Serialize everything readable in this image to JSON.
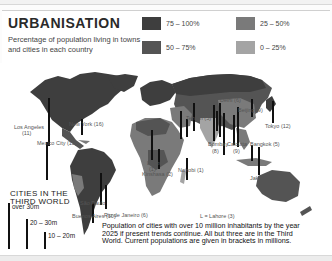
{
  "header": {
    "title": "URBANISATION",
    "subtitle": "Percentage of population living in towns and cities in each country"
  },
  "legend": [
    {
      "label": "75 – 100%",
      "color": "#3e3e3e"
    },
    {
      "label": "50 – 75%",
      "color": "#545454"
    },
    {
      "label": "25 – 50%",
      "color": "#7a7a7a"
    },
    {
      "label": "0 – 25%",
      "color": "#a4a4a4"
    }
  ],
  "cities": [
    {
      "label": "Los Angeles (11)",
      "short": "Los Angeles",
      "pop": "(11)"
    },
    {
      "label": "New York (16)"
    },
    {
      "label": "Mexico City (15)",
      "short": "(15)"
    },
    {
      "label": "Rio de Janeiro (6)"
    },
    {
      "label": "Sao Paulo (10)",
      "short": "São Paulo"
    },
    {
      "label": "Buenos Aires (10)"
    },
    {
      "label": "Lagos (1)",
      "short": "Lagos",
      "pop": "(1)"
    },
    {
      "label": "Kinshasa (2)"
    },
    {
      "label": "Nairobi (1)"
    },
    {
      "label": "Tehran (5)"
    },
    {
      "label": "Delhi (6)"
    },
    {
      "label": "Beijing (9)"
    },
    {
      "label": "Tokyo (12)"
    },
    {
      "label": "Bombay (8)",
      "short": "Bombay",
      "pop": "(8)"
    },
    {
      "label": "Calcutta (9)",
      "short": "Calcutta",
      "pop": "(9)"
    },
    {
      "label": "Bangkok (5)"
    },
    {
      "label": "Jakarta (7)"
    }
  ],
  "map_note": "L = Lahore (3)",
  "scale": {
    "title_line1": "CITIES IN THE",
    "title_line2": "THIRD WORLD",
    "items": [
      {
        "label": "over 30m"
      },
      {
        "label": "20 – 30m"
      },
      {
        "label": "10 – 20m"
      }
    ]
  },
  "caption": "Population of cities with over 10 million inhabitants by the year 2025 if present trends continue. All but three are in the Third World. Current populations are given in brackets in millions."
}
